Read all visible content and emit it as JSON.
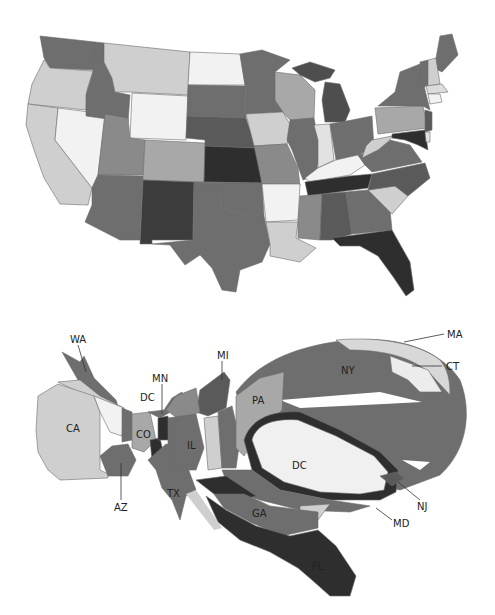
{
  "figure": {
    "top_cutoff_text": "",
    "panels": [
      {
        "id": "geographic-map",
        "description": "Choropleth map of the contiguous United States in greyscale",
        "shades": {
          "white": "#f2f2f2",
          "light": "#cfcfcf",
          "mid_light": "#a8a8a8",
          "mid": "#8a8a8a",
          "mid_dark": "#6e6e6e",
          "dark": "#4a4a4a",
          "darkest": "#2e2e2e"
        }
      },
      {
        "id": "cartogram",
        "description": "Distorted area cartogram of the United States",
        "labels": {
          "wa": "WA",
          "ca": "CA",
          "az": "AZ",
          "co": "CO",
          "dc_west": "DC",
          "mn": "MN",
          "mi": "MI",
          "il": "IL",
          "tx": "TX",
          "pa": "PA",
          "ny": "NY",
          "dc": "DC",
          "ma": "MA",
          "ct": "CT",
          "nj": "NJ",
          "md": "MD",
          "ga": "GA",
          "fl": "FL"
        }
      }
    ]
  }
}
